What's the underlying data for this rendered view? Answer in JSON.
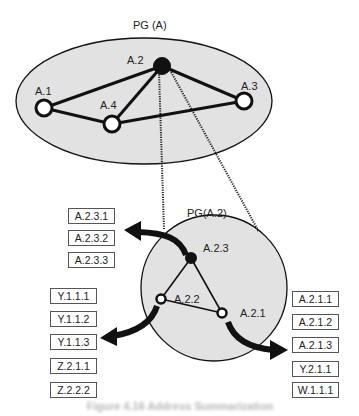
{
  "diagram": {
    "outer_group": {
      "label": "PG (A)",
      "nodes": [
        {
          "id": "A.1",
          "label": "A.1",
          "filled": false
        },
        {
          "id": "A.2",
          "label": "A.2",
          "filled": true
        },
        {
          "id": "A.3",
          "label": "A.3",
          "filled": false
        },
        {
          "id": "A.4",
          "label": "A.4",
          "filled": false
        }
      ],
      "edges": [
        [
          "A.1",
          "A.2"
        ],
        [
          "A.1",
          "A.4"
        ],
        [
          "A.4",
          "A.2"
        ],
        [
          "A.4",
          "A.3"
        ],
        [
          "A.2",
          "A.3"
        ]
      ]
    },
    "inner_group": {
      "label": "PG(A.2)",
      "nodes": [
        {
          "id": "A.2.3",
          "label": "A.2.3",
          "filled": true
        },
        {
          "id": "A.2.2",
          "label": "A.2.2",
          "filled": false
        },
        {
          "id": "A.2.1",
          "label": "A.2.1",
          "filled": false
        }
      ],
      "edges": [
        [
          "A.2.3",
          "A.2.2"
        ],
        [
          "A.2.3",
          "A.2.1"
        ],
        [
          "A.2.2",
          "A.2.1"
        ]
      ]
    },
    "address_lists": {
      "a23": [
        "A.2.3.1",
        "A.2.3.2",
        "A.2.3.3"
      ],
      "a22": [
        "Y.1.1.1",
        "Y.1.1.2",
        "Y.1.1.3",
        "Z.2.1.1",
        "Z.2.2.2"
      ],
      "a21": [
        "A.2.1.1",
        "A.2.1.2",
        "A.2.1.3",
        "Y.2.1.1",
        "W.1.1.1"
      ]
    },
    "caption": "Figure 4.16 Address Summarization"
  },
  "colors": {
    "group_fill": "#e2e2e2",
    "stroke": "#111111",
    "filled_node": "#111111",
    "open_node": "#ffffff"
  }
}
